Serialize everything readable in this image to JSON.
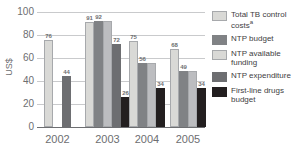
{
  "chart_data": {
    "type": "bar",
    "title": "",
    "subtitle": "",
    "xlabel": "",
    "ylabel": "US$",
    "ylim": [
      0,
      100
    ],
    "y_ticks": [
      100,
      80,
      60,
      40,
      20,
      0
    ],
    "grid": true,
    "legend_position": "right",
    "categories": [
      "2002",
      "2003",
      "2004",
      "2005"
    ],
    "series": [
      {
        "name": "Total TB control costs",
        "name_superscript": "a",
        "color": "#d9d9d6",
        "values": [
          76,
          91,
          75,
          68
        ]
      },
      {
        "name": "NTP budget",
        "color": "#808285",
        "values": [
          null,
          92,
          56,
          49
        ]
      },
      {
        "name": "NTP available funding",
        "color": "#d9d9d6",
        "values": [
          null,
          92,
          56,
          49
        ]
      },
      {
        "name": "NTP expenditure",
        "color": "#6d6e71",
        "values": [
          44,
          72,
          null,
          null
        ]
      },
      {
        "name": "First-line drugs budget",
        "color": "#231f20",
        "values": [
          null,
          26,
          34,
          34
        ]
      }
    ],
    "groups": [
      {
        "category": "2002",
        "bars": [
          {
            "series": "Total TB control costs",
            "value": 76,
            "label": "76",
            "color": "#d9d9d6"
          },
          {
            "series": "gap",
            "value": null,
            "label": "",
            "color": "none"
          },
          {
            "series": "NTP expenditure",
            "value": 44,
            "label": "44",
            "color": "#6d6e71"
          }
        ]
      },
      {
        "category": "2003",
        "bars": [
          {
            "series": "Total TB control costs",
            "value": 91,
            "label": "91",
            "color": "#d9d9d6"
          },
          {
            "series": "NTP budget",
            "value": 92,
            "label": "92",
            "color": "#808285"
          },
          {
            "series": "NTP available funding",
            "value": 92,
            "label": "",
            "color": "#bcbdc0"
          },
          {
            "series": "NTP expenditure",
            "value": 72,
            "label": "72",
            "color": "#6d6e71"
          },
          {
            "series": "First-line drugs budget",
            "value": 26,
            "label": "26",
            "color": "#231f20"
          }
        ]
      },
      {
        "category": "2004",
        "bars": [
          {
            "series": "Total TB control costs",
            "value": 75,
            "label": "75",
            "color": "#d9d9d6"
          },
          {
            "series": "NTP budget",
            "value": 56,
            "label": "56",
            "color": "#808285"
          },
          {
            "series": "NTP available funding",
            "value": 56,
            "label": "",
            "color": "#bcbdc0"
          },
          {
            "series": "First-line drugs budget",
            "value": 34,
            "label": "34",
            "color": "#231f20"
          }
        ]
      },
      {
        "category": "2005",
        "bars": [
          {
            "series": "Total TB control costs",
            "value": 68,
            "label": "68",
            "color": "#d9d9d6"
          },
          {
            "series": "NTP budget",
            "value": 49,
            "label": "49",
            "color": "#808285"
          },
          {
            "series": "NTP available funding",
            "value": 49,
            "label": "",
            "color": "#bcbdc0"
          },
          {
            "series": "First-line drugs budget",
            "value": 34,
            "label": "34",
            "color": "#231f20"
          }
        ]
      }
    ]
  },
  "axes": {
    "y_title": "US$",
    "y_ticks": [
      "100",
      "80",
      "60",
      "40",
      "20",
      "0"
    ],
    "x_ticks": [
      "2002",
      "2003",
      "2004",
      "2005"
    ]
  },
  "legend": {
    "items": [
      {
        "label": "Total TB control costs",
        "superscript": "a",
        "swatch": "#d9d9d6",
        "border": "#a7a9ac"
      },
      {
        "label": "NTP budget",
        "superscript": "",
        "swatch": "#808285",
        "border": "#808285"
      },
      {
        "label": "NTP available funding",
        "superscript": "",
        "swatch": "#d9d9d6",
        "border": "#a7a9ac"
      },
      {
        "label": "NTP expenditure",
        "superscript": "",
        "swatch": "#6d6e71",
        "border": "#6d6e71"
      },
      {
        "label": "First-line drugs budget",
        "superscript": "",
        "swatch": "#231f20",
        "border": "#231f20"
      }
    ]
  },
  "colors": {
    "grid": "#c9cacc",
    "axis": "#6d6e71",
    "text": "#6d6e71",
    "legend_text": "#414042",
    "background": "#ffffff"
  }
}
